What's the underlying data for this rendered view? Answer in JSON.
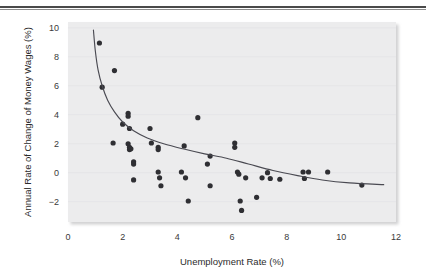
{
  "figure": {
    "name": "phillips-curve-scatter",
    "background_color": "#ffffff",
    "plot_background_color": "#ececed",
    "rule_color": "#4a4a4a"
  },
  "chart_data": {
    "type": "scatter",
    "title": "",
    "xlabel": "Unemployment Rate (%)",
    "ylabel": "Annual Rate of Change of Money Wages (%)",
    "xlim": [
      0,
      12
    ],
    "ylim": [
      -3.4,
      10.4
    ],
    "xticks": [
      0,
      2,
      4,
      6,
      8,
      10,
      12
    ],
    "yticks": [
      -2,
      0,
      2,
      4,
      6,
      8,
      10
    ],
    "xtick_labels": [
      "0",
      "2",
      "4",
      "6",
      "8",
      "10",
      "12"
    ],
    "ytick_labels": [
      "−2",
      "0",
      "2",
      "4",
      "6",
      "8",
      "10"
    ],
    "grid": false,
    "legend": "none",
    "marker_color": "#2f2f33",
    "marker_size": 2.6,
    "points": [
      {
        "x": 1.15,
        "y": 8.95
      },
      {
        "x": 1.25,
        "y": 5.9
      },
      {
        "x": 1.7,
        "y": 7.05
      },
      {
        "x": 1.65,
        "y": 2.05
      },
      {
        "x": 2.0,
        "y": 3.35
      },
      {
        "x": 2.2,
        "y": 4.1
      },
      {
        "x": 2.2,
        "y": 3.9
      },
      {
        "x": 2.25,
        "y": 3.05
      },
      {
        "x": 2.2,
        "y": 2.0
      },
      {
        "x": 2.25,
        "y": 1.75
      },
      {
        "x": 2.25,
        "y": 1.6
      },
      {
        "x": 2.3,
        "y": 1.65
      },
      {
        "x": 2.4,
        "y": 0.75
      },
      {
        "x": 2.4,
        "y": 0.6
      },
      {
        "x": 2.4,
        "y": -0.5
      },
      {
        "x": 3.0,
        "y": 3.05
      },
      {
        "x": 3.05,
        "y": 2.05
      },
      {
        "x": 3.3,
        "y": 1.75
      },
      {
        "x": 3.3,
        "y": 1.6
      },
      {
        "x": 3.3,
        "y": 0.05
      },
      {
        "x": 3.35,
        "y": -0.35
      },
      {
        "x": 3.4,
        "y": -0.9
      },
      {
        "x": 4.15,
        "y": 0.05
      },
      {
        "x": 4.25,
        "y": 1.85
      },
      {
        "x": 4.3,
        "y": -0.35
      },
      {
        "x": 4.4,
        "y": -1.95
      },
      {
        "x": 4.75,
        "y": 3.8
      },
      {
        "x": 5.1,
        "y": 0.6
      },
      {
        "x": 5.2,
        "y": 1.15
      },
      {
        "x": 5.2,
        "y": -0.9
      },
      {
        "x": 6.1,
        "y": 2.05
      },
      {
        "x": 6.1,
        "y": 1.75
      },
      {
        "x": 6.2,
        "y": 0.05
      },
      {
        "x": 6.25,
        "y": -0.1
      },
      {
        "x": 6.3,
        "y": -1.95
      },
      {
        "x": 6.35,
        "y": -2.6
      },
      {
        "x": 6.5,
        "y": -0.35
      },
      {
        "x": 6.9,
        "y": -1.7
      },
      {
        "x": 7.1,
        "y": -0.35
      },
      {
        "x": 7.3,
        "y": 0.0
      },
      {
        "x": 7.4,
        "y": -0.4
      },
      {
        "x": 7.75,
        "y": -0.45
      },
      {
        "x": 8.6,
        "y": 0.05
      },
      {
        "x": 8.8,
        "y": 0.05
      },
      {
        "x": 8.65,
        "y": -0.4
      },
      {
        "x": 9.5,
        "y": 0.05
      },
      {
        "x": 10.75,
        "y": -0.85
      }
    ],
    "fit_curve": {
      "name": "phillips-curve-fit",
      "color": "#4a4a52",
      "x_start": 0.93,
      "x_end": 11.55,
      "description": "hyperbolic Phillips curve fitted through the scatter",
      "path_points": [
        {
          "x": 0.93,
          "y": 9.85
        },
        {
          "x": 1.0,
          "y": 8.4
        },
        {
          "x": 1.1,
          "y": 7.1
        },
        {
          "x": 1.25,
          "y": 6.0
        },
        {
          "x": 1.45,
          "y": 5.0
        },
        {
          "x": 1.7,
          "y": 4.2
        },
        {
          "x": 2.0,
          "y": 3.5
        },
        {
          "x": 2.4,
          "y": 2.9
        },
        {
          "x": 2.9,
          "y": 2.4
        },
        {
          "x": 3.5,
          "y": 2.0
        },
        {
          "x": 4.2,
          "y": 1.65
        },
        {
          "x": 5.0,
          "y": 1.3
        },
        {
          "x": 5.8,
          "y": 1.0
        },
        {
          "x": 6.6,
          "y": 0.6
        },
        {
          "x": 7.5,
          "y": 0.15
        },
        {
          "x": 8.4,
          "y": -0.2
        },
        {
          "x": 9.3,
          "y": -0.5
        },
        {
          "x": 10.3,
          "y": -0.7
        },
        {
          "x": 11.55,
          "y": -0.82
        }
      ]
    }
  }
}
